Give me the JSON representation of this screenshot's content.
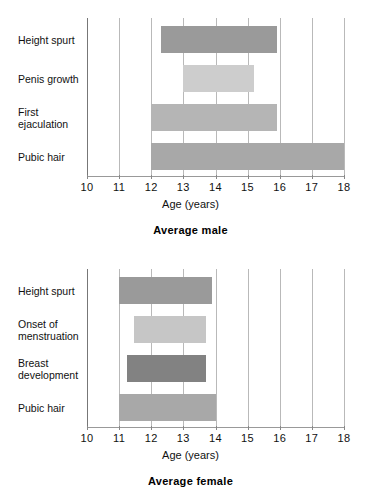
{
  "chart_data": [
    {
      "type": "bar",
      "orientation": "horizontal",
      "title": "Average male",
      "xlabel": "Age (years)",
      "ylabel": "",
      "xlim": [
        10,
        18
      ],
      "xticks": [
        10,
        11,
        12,
        13,
        14,
        15,
        16,
        17,
        18
      ],
      "xtick_labels": [
        "10",
        "11",
        "12",
        "13",
        "14",
        "15",
        "16",
        "17",
        "18"
      ],
      "grid": true,
      "legend": "none",
      "categories": [
        "Height spurt",
        "Penis growth",
        "First\nejaculation",
        "Pubic hair"
      ],
      "bars": [
        {
          "label": "Height spurt",
          "start": 12.3,
          "end": 15.9,
          "color": "#9a9a9a"
        },
        {
          "label": "Penis growth",
          "start": 13.0,
          "end": 15.2,
          "color": "#cdcdcd"
        },
        {
          "label": "First\nejaculation",
          "start": 12.0,
          "end": 15.9,
          "color": "#b5b5b5"
        },
        {
          "label": "Pubic hair",
          "start": 12.0,
          "end": 18.0,
          "color": "#a8a8a8"
        }
      ]
    },
    {
      "type": "bar",
      "orientation": "horizontal",
      "title": "Average female",
      "xlabel": "Age (years)",
      "ylabel": "",
      "xlim": [
        10,
        18
      ],
      "xticks": [
        10,
        11,
        12,
        13,
        14,
        15,
        16,
        17,
        18
      ],
      "xtick_labels": [
        "10",
        "11",
        "12",
        "13",
        "14",
        "15",
        "16",
        "17",
        "18"
      ],
      "grid": true,
      "legend": "none",
      "categories": [
        "Height spurt",
        "Onset of\nmenstruation",
        "Breast\ndevelopment",
        "Pubic hair"
      ],
      "bars": [
        {
          "label": "Height spurt",
          "start": 11.0,
          "end": 13.9,
          "color": "#9a9a9a"
        },
        {
          "label": "Onset of\nmenstruation",
          "start": 11.45,
          "end": 13.7,
          "color": "#c6c6c6"
        },
        {
          "label": "Breast\ndevelopment",
          "start": 11.25,
          "end": 13.7,
          "color": "#828282"
        },
        {
          "label": "Pubic hair",
          "start": 11.0,
          "end": 14.0,
          "color": "#a8a8a8"
        }
      ]
    }
  ],
  "colors": {
    "background": "#ffffff",
    "axis": "#777777",
    "gridline": "#b9b9b9",
    "text": "#111111"
  }
}
